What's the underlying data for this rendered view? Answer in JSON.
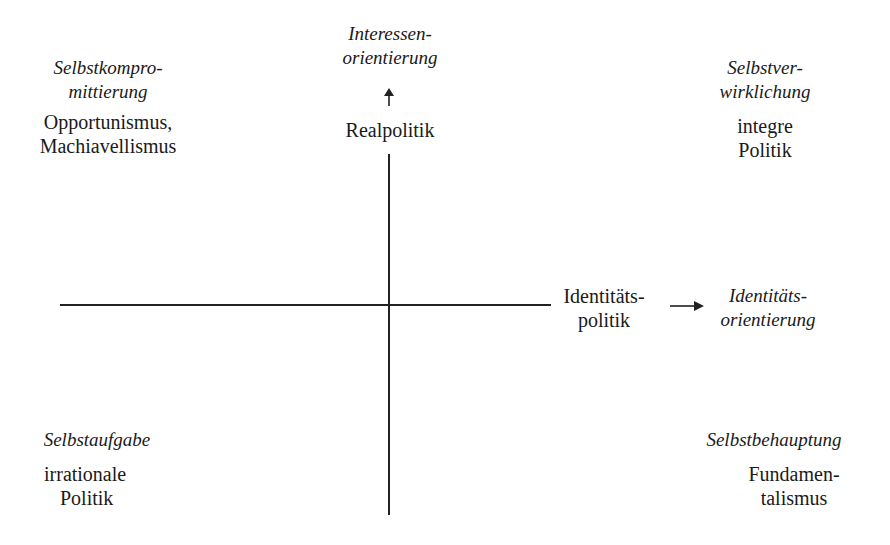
{
  "diagram": {
    "type": "quadrant",
    "axes": {
      "vertical": {
        "start_label": "Realpolitik",
        "end_label_line1": "Interessen-",
        "end_label_line2": "orientierung",
        "arrow": "up-arrow"
      },
      "horizontal": {
        "start_label_line1": "Identitäts-",
        "start_label_line2": "politik",
        "end_label_line1": "Identitäts-",
        "end_label_line2": "orientierung",
        "arrow": "right-arrow"
      }
    },
    "quadrants": {
      "top_left": {
        "title_line1": "Selbstkompro-",
        "title_line2": "mittierung",
        "desc_line1": "Opportunismus,",
        "desc_line2": "Machiavellismus"
      },
      "top_right": {
        "title_line1": "Selbstver-",
        "title_line2": "wirklichung",
        "desc_line1": "integre",
        "desc_line2": "Politik"
      },
      "bottom_left": {
        "title_line1": "Selbstaufgabe",
        "desc_line1": "irrationale",
        "desc_line2": "Politik"
      },
      "bottom_right": {
        "title_line1": "Selbstbehauptung",
        "desc_line1": "Fundamen-",
        "desc_line2": "talismus"
      }
    },
    "colors": {
      "ink": "#1a1a1a",
      "background": "#ffffff"
    }
  }
}
